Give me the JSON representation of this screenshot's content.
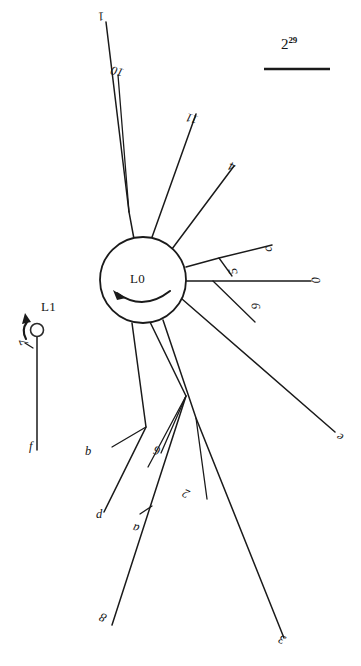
{
  "figure": {
    "kind": "radial-link-diagram",
    "background_color": "#ffffff",
    "ink_color": "#1a1a1a"
  },
  "scale_legend": {
    "base": "2",
    "exponent": "29",
    "bar_visible": true
  },
  "nodes": [
    {
      "id": "L0",
      "label": "L0",
      "cx": 143,
      "cy": 280,
      "r": 43,
      "has_spin_arrow": true
    },
    {
      "id": "L1",
      "label": "L1",
      "cx": 37,
      "cy": 330,
      "r": 6.5,
      "has_spin_arrow": true
    }
  ],
  "edges": [
    {
      "name": "edge-1",
      "label": "1",
      "end_label": "1",
      "inner_label": "10",
      "from": "L0",
      "to_x": 106,
      "to_y": 22
    },
    {
      "name": "edge-11",
      "label": "11",
      "end_label": "11",
      "inner_label": "",
      "from": "L0",
      "to_x": 196,
      "to_y": 114
    },
    {
      "name": "edge-4",
      "label": "4",
      "end_label": "4",
      "inner_label": "",
      "from": "L0",
      "to_x": 234,
      "to_y": 166
    },
    {
      "name": "edge-c",
      "label": "c",
      "end_label": "c",
      "inner_label": "5",
      "from": "L0",
      "to_x": 272,
      "to_y": 245
    },
    {
      "name": "edge-0",
      "label": "0",
      "end_label": "0",
      "inner_label": "9",
      "from": "L0",
      "to_x": 318,
      "to_y": 281
    },
    {
      "name": "edge-e",
      "label": "e",
      "end_label": "e",
      "inner_label": "",
      "from": "L0",
      "to_x": 339,
      "to_y": 436
    },
    {
      "name": "edge-3",
      "label": "3",
      "end_label": "3",
      "inner_label": "2",
      "from": "L0",
      "to_x": 284,
      "to_y": 638
    },
    {
      "name": "edge-8",
      "label": "8",
      "end_label": "8",
      "inner_label": "a",
      "from": "L0",
      "to_x": 112,
      "to_y": 625
    },
    {
      "name": "edge-d",
      "label": "d",
      "end_label": "d",
      "inner_label": "b",
      "from": "L0",
      "to_x": 104,
      "to_y": 512
    },
    {
      "name": "edge-6",
      "label": "6",
      "end_label": "",
      "inner_label": "6",
      "from": "L0",
      "to_x": 186,
      "to_y": 396
    },
    {
      "name": "edge-f",
      "label": "f",
      "end_label": "f",
      "inner_label": "7",
      "from": "L1",
      "to_x": 37,
      "to_y": 450
    }
  ],
  "edge_labels": {
    "e1_end": "1",
    "e1_mid": "10",
    "e11_end": "11",
    "e4_end": "4",
    "ec_end": "c",
    "ec_mid": "5",
    "e0_end": "0",
    "e0_mid": "9",
    "ee_end": "e",
    "e3_end": "3",
    "e3_mid": "2",
    "e8_end": "8",
    "e8_mid": "a",
    "ed_end": "d",
    "ed_mid": "b",
    "e6_mid": "6",
    "ef_end": "f",
    "ef_mid": "7"
  },
  "node_labels": {
    "l0": "L0",
    "l1": "L1"
  }
}
